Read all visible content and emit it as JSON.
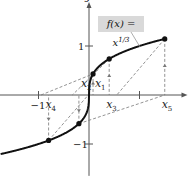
{
  "chart_data": {
    "type": "line",
    "title": "",
    "function_label": "f(x) = x",
    "function_exponent": "1/3",
    "xlabel": "x",
    "ylabel": "y",
    "xlim": [
      -1.75,
      1.95
    ],
    "ylim": [
      -1.65,
      1.9
    ],
    "x_ticks": [
      {
        "value": -1,
        "label": "−1"
      },
      {
        "value": 1,
        "label": ""
      }
    ],
    "y_ticks": [
      {
        "value": 1,
        "label": "1"
      },
      {
        "value": -1,
        "label": "−1"
      }
    ],
    "curve": {
      "name": "f(x) = x^(1/3)",
      "x_from": -1.75,
      "x_to": 1.5
    },
    "points": [
      {
        "name": "x1",
        "x": 0.08,
        "y": 0.43
      },
      {
        "name": "x2",
        "x": -0.2,
        "y": -0.585
      },
      {
        "name": "x3",
        "x": 0.4,
        "y": 0.737
      },
      {
        "name": "x4",
        "x": -0.8,
        "y": -0.928
      },
      {
        "name": "x5",
        "x": 1.5,
        "y": 1.145
      }
    ],
    "x_labels": [
      {
        "base": "x",
        "sub": "1",
        "x": 0.08,
        "side": "above"
      },
      {
        "base": "x",
        "sub": "2",
        "x": -0.2,
        "side": "above"
      },
      {
        "base": "x",
        "sub": "3",
        "x": 0.4,
        "side": "below"
      },
      {
        "base": "x",
        "sub": "4",
        "x": -0.8,
        "side": "below"
      },
      {
        "base": "x",
        "sub": "5",
        "x": 1.5,
        "side": "below"
      }
    ],
    "grid": false,
    "legend": "none"
  }
}
